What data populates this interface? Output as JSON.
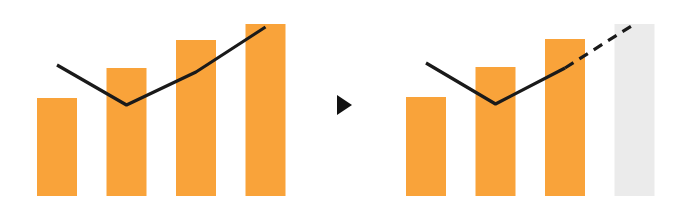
{
  "colors": {
    "bar": "#f9a33a",
    "ghost_bar": "#ebebeb",
    "line": "#1a1a1a",
    "arrow": "#111111",
    "background": "#ffffff"
  },
  "chart_data": [
    {
      "type": "bar",
      "title": "",
      "description": "Bar chart with overlaid trend line (actual)",
      "categories": [
        "1",
        "2",
        "3",
        "4"
      ],
      "series": [
        {
          "name": "bars",
          "kind": "bar",
          "values": [
            98,
            128,
            156,
            172
          ]
        },
        {
          "name": "line",
          "kind": "line",
          "values": [
            131,
            91,
            124,
            169
          ]
        }
      ],
      "xlabel": "",
      "ylabel": "",
      "ylim": [
        0,
        180
      ],
      "grid": false,
      "legend": null
    },
    {
      "type": "bar",
      "title": "",
      "description": "Same chart with last bar as forecast placeholder and dashed projected line",
      "categories": [
        "1",
        "2",
        "3",
        "4"
      ],
      "series": [
        {
          "name": "bars",
          "kind": "bar",
          "values": [
            99,
            129,
            157,
            null
          ]
        },
        {
          "name": "forecast_placeholder",
          "kind": "bar",
          "values": [
            null,
            null,
            null,
            172
          ]
        },
        {
          "name": "line",
          "kind": "line",
          "values": [
            133,
            92,
            128,
            null
          ]
        },
        {
          "name": "line_projection",
          "kind": "line",
          "style": "dashed",
          "values": [
            null,
            null,
            128,
            172
          ]
        }
      ],
      "xlabel": "",
      "ylabel": "",
      "ylim": [
        0,
        180
      ],
      "grid": false,
      "legend": null
    }
  ],
  "transition_icon": "play-arrow-icon"
}
